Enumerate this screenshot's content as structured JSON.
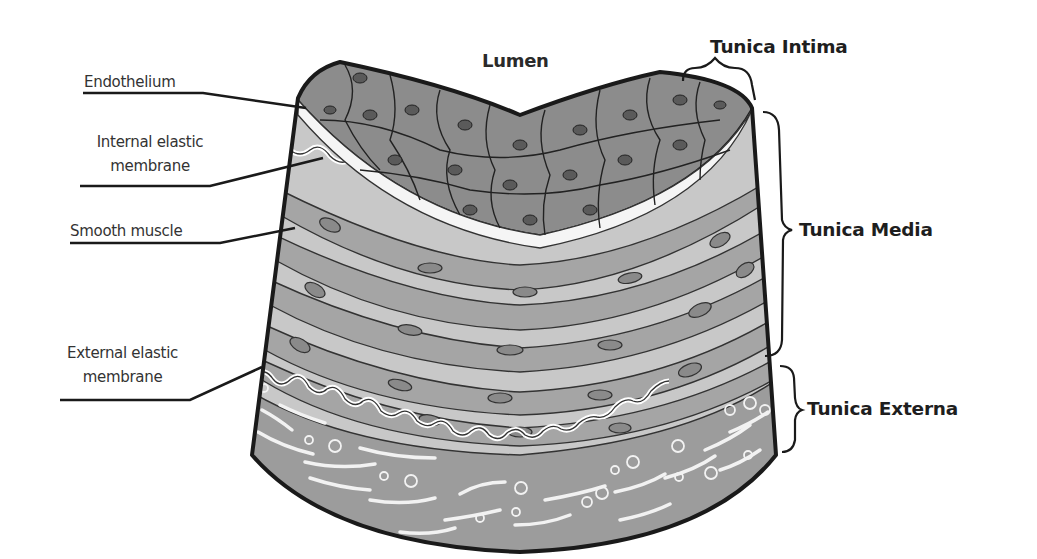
{
  "labels": {
    "lumen": "Lumen",
    "endothelium": "Endothelium",
    "internal_elastic_membrane": [
      "Internal elastic",
      "membrane"
    ],
    "smooth_muscle": "Smooth muscle",
    "external_elastic_membrane": [
      "External elastic",
      "membrane"
    ]
  },
  "layers": {
    "tunica_intima": "Tunica Intima",
    "tunica_media": "Tunica Media",
    "tunica_externa": "Tunica Externa"
  },
  "colors": {
    "outline": "#1a1a1a",
    "endothelial_cell": "#8c8c8c",
    "endothelial_nucleus": "#5a5a5a",
    "media_background": "#c8c8c8",
    "smooth_muscle_cell": "#a5a5a5",
    "smooth_muscle_nucleus": "#8a8a8a",
    "externa_background": "#9c9c9c",
    "fiber": "#f2f2f2"
  }
}
